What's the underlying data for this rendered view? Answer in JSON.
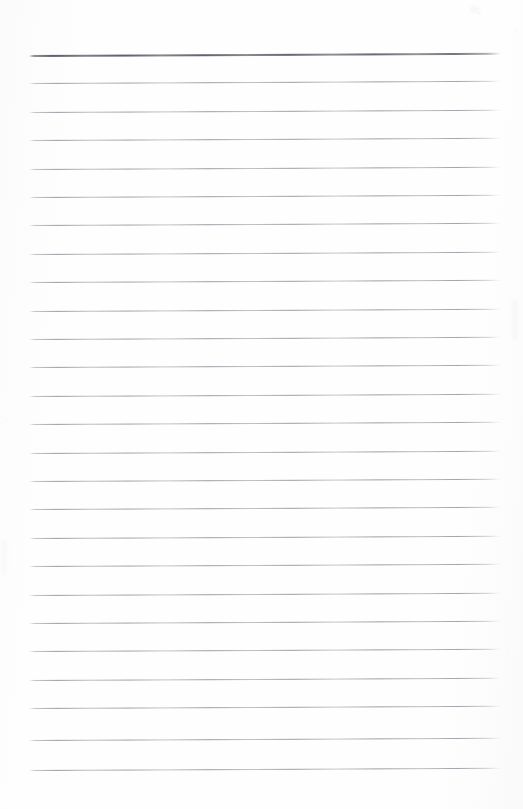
{
  "document": {
    "kind": "scanned-lined-paper",
    "title": "Blank ruled notebook page",
    "page_width": 523,
    "page_height": 809,
    "background_color": "#fefefe",
    "text_content": "",
    "has_handwriting": false,
    "has_printed_text": false
  },
  "ruling": {
    "line_color": "#8e9096",
    "emphasis_line_color": "#5d5f67",
    "line_count": 26,
    "first_line_y": 55,
    "line_spacing": 28.4,
    "left_margin_x": 29,
    "right_margin_x": 501,
    "line_length": 472,
    "skew_degrees": -0.28,
    "emphasis_line_index": 0,
    "lines": [
      {
        "index": 0,
        "y": 55,
        "emphasis": true
      },
      {
        "index": 1,
        "y": 83.4,
        "emphasis": false
      },
      {
        "index": 2,
        "y": 111.8,
        "emphasis": false
      },
      {
        "index": 3,
        "y": 140.2,
        "emphasis": false
      },
      {
        "index": 4,
        "y": 168.6,
        "emphasis": false
      },
      {
        "index": 5,
        "y": 197.0,
        "emphasis": false
      },
      {
        "index": 6,
        "y": 225.4,
        "emphasis": false
      },
      {
        "index": 7,
        "y": 253.8,
        "emphasis": false
      },
      {
        "index": 8,
        "y": 282.2,
        "emphasis": false
      },
      {
        "index": 9,
        "y": 310.6,
        "emphasis": false
      },
      {
        "index": 10,
        "y": 339.0,
        "emphasis": false
      },
      {
        "index": 11,
        "y": 367.4,
        "emphasis": false
      },
      {
        "index": 12,
        "y": 395.8,
        "emphasis": false
      },
      {
        "index": 13,
        "y": 424.2,
        "emphasis": false
      },
      {
        "index": 14,
        "y": 452.6,
        "emphasis": false
      },
      {
        "index": 15,
        "y": 481.0,
        "emphasis": false
      },
      {
        "index": 16,
        "y": 509.4,
        "emphasis": false
      },
      {
        "index": 17,
        "y": 537.8,
        "emphasis": false
      },
      {
        "index": 18,
        "y": 566.2,
        "emphasis": false
      },
      {
        "index": 19,
        "y": 594.6,
        "emphasis": false
      },
      {
        "index": 20,
        "y": 623.0,
        "emphasis": false
      },
      {
        "index": 21,
        "y": 651.4,
        "emphasis": false
      },
      {
        "index": 22,
        "y": 679.8,
        "emphasis": false
      },
      {
        "index": 23,
        "y": 708.2,
        "emphasis": false
      },
      {
        "index": 24,
        "y": 740.0,
        "emphasis": false
      },
      {
        "index": 25,
        "y": 769.5,
        "emphasis": false
      }
    ]
  },
  "artifacts": {
    "specks": [
      {
        "x": 478,
        "y": 12,
        "size": 3.0,
        "opacity": 0.3
      },
      {
        "x": 515,
        "y": 30,
        "size": 2.2,
        "opacity": 0.22
      },
      {
        "x": 6,
        "y": 420,
        "size": 2.0,
        "opacity": 0.18
      },
      {
        "x": 14,
        "y": 596,
        "size": 2.4,
        "opacity": 0.2
      },
      {
        "x": 508,
        "y": 648,
        "size": 2.0,
        "opacity": 0.18
      }
    ],
    "edge_smudges": [
      {
        "x": 470,
        "y": 6,
        "width": 9,
        "height": 7,
        "opacity": 0.35
      },
      {
        "x": 512,
        "y": 300,
        "width": 6,
        "height": 40,
        "opacity": 0.28
      },
      {
        "x": 2,
        "y": 540,
        "width": 5,
        "height": 34,
        "opacity": 0.25
      }
    ]
  }
}
